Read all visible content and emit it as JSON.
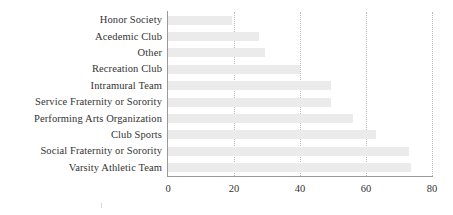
{
  "chart_data": {
    "type": "bar",
    "orientation": "horizontal",
    "title": "",
    "subtitle": "",
    "xlabel": "",
    "ylabel": "",
    "xlim": [
      0,
      80
    ],
    "xticks": [
      "0",
      "20",
      "40",
      "60",
      "80"
    ],
    "xtick_values": [
      0,
      20,
      40,
      60,
      80
    ],
    "grid": "vertical-dotted",
    "legend": "none",
    "bar_color": "#ebebeb",
    "axis_color": "#9a9a9a",
    "gridline_color": "#b9b9b9",
    "text_color": "#333333",
    "categories": [
      "Honor Society",
      "Acedemic Club",
      "Other",
      "Recreation Club",
      "Intramural Team",
      "Service Fraternity or Sorority",
      "Performing Arts Organization",
      "Club Sports",
      "Social Fraternity or Sorority",
      "Varsity Athletic Team"
    ],
    "values": [
      19.5,
      27.5,
      29.5,
      40,
      49.5,
      49.5,
      56,
      63,
      73,
      73.5
    ]
  }
}
